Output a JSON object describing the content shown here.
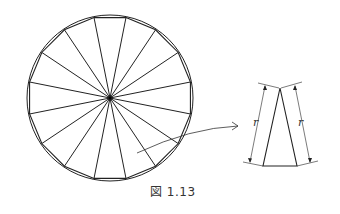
{
  "figure": {
    "caption": "図 1.13",
    "polygon": {
      "sides": 16,
      "center": [
        110,
        98
      ],
      "radius": 82,
      "angle_offset_deg": 11.25
    },
    "label_r_left": "r",
    "label_r_right": "r"
  }
}
